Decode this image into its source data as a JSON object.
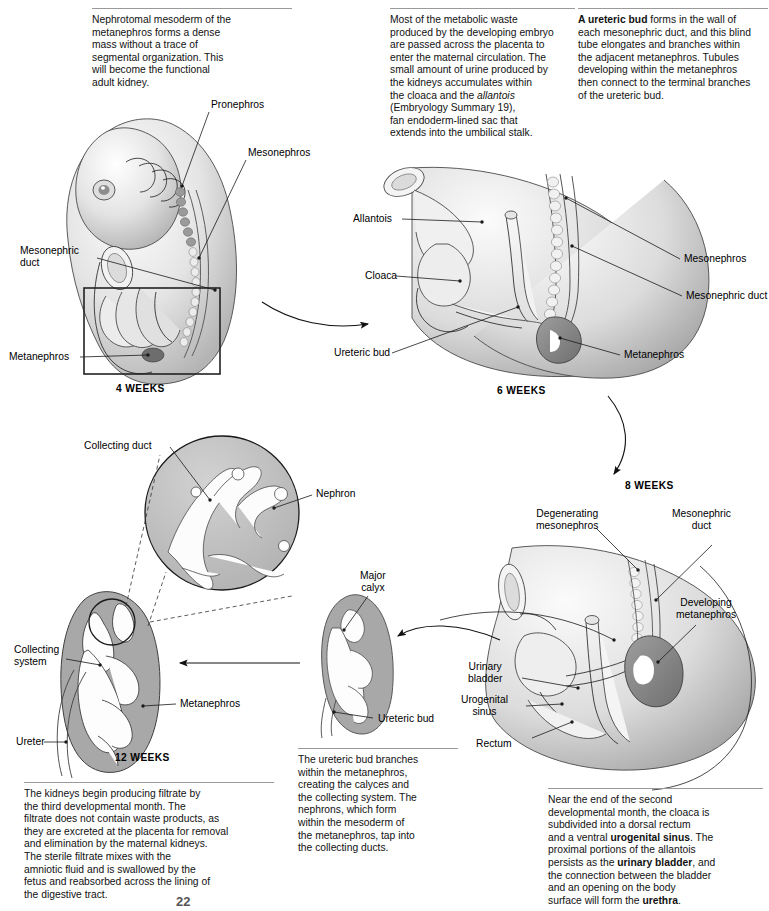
{
  "figure": {
    "page_number": "22"
  },
  "captions": {
    "metanephros_note": "Nephrotomal mesoderm of the\nmetanephros forms a dense\nmass without a trace of\nsegmental organization. This\nwill become the functional\nadult kidney.",
    "metabolic_waste_note_a": "Most of the metabolic waste\nproduced by the developing embryo\nare passed across the placenta to\nenter the maternal circulation. The\nsmall amount of urine produced by\nthe kidneys accumulates within\nthe cloaca and the ",
    "metabolic_waste_italic": "allantois",
    "metabolic_waste_note_b": "\n(Embryology Summary 19),\nfan endoderm-lined sac that\nextends into the umbilical stalk.",
    "ureteric_bud_bold": "A ureteric bud",
    "ureteric_bud_note": " forms in the wall of\neach mesonephric duct, and this blind\ntube elongates and branches within\nthe adjacent metanephros. Tubules\ndeveloping within the metanephros\nthen connect to the terminal branches\nof the ureteric bud.",
    "twelve_week_note": "The kidneys begin producing filtrate by\nthe third developmental month. The\nfiltrate does not contain waste products, as\nthey are excreted at the placenta for removal\nand elimination by the maternal kidneys.\nThe sterile filtrate mixes with the\namniotic fluid and is swallowed by the\nfetus and reabsorbed across the lining of\nthe digestive tract.",
    "ureteric_branch_note": "The ureteric bud branches\nwithin the metanephros,\ncreating the calyces and\nthe collecting system. The\nnephrons, which form\nwithin the mesoderm of\nthe metanephros, tap into\nthe collecting ducts.",
    "cloaca_subdivision_a": "Near the end of the second\ndevelopmental month, the cloaca is\nsubdivided into a dorsal rectum\nand a ventral ",
    "cloaca_subdivision_bold1": "urogenital sinus",
    "cloaca_subdivision_b": ". The\nproximal portions of the allantois\npersists as the ",
    "cloaca_subdivision_bold2": "urinary bladder",
    "cloaca_subdivision_c": ", and\nthe connection between the bladder\nand an opening on the body\nsurface will form the ",
    "cloaca_subdivision_bold3": "urethra",
    "cloaca_subdivision_d": "."
  },
  "stages": {
    "four_weeks": "4 WEEKS",
    "six_weeks": "6 WEEKS",
    "eight_weeks": "8 WEEKS",
    "twelve_weeks": "12 WEEKS"
  },
  "labels": {
    "pronephros": "Pronephros",
    "mesonephros_embryo": "Mesonephros",
    "mesonephric_duct_embryo": "Mesonephric\nduct",
    "metanephros_embryo": "Metanephros",
    "allantois": "Allantois",
    "cloaca": "Cloaca",
    "ureteric_bud_6w": "Ureteric bud",
    "mesonephros_6w": "Mesonephros",
    "mesonephric_duct_6w": "Mesonephric duct",
    "metanephros_6w": "Metanephros",
    "degenerating_mesonephros": "Degenerating\nmesonephros",
    "mesonephric_duct_8w": "Mesonephric\nduct",
    "developing_metanephros": "Developing\nmetanephros",
    "urinary_bladder": "Urinary\nbladder",
    "urogenital_sinus": "Urogenital\nsinus",
    "rectum": "Rectum",
    "collecting_duct": "Collecting duct",
    "nephron": "Nephron",
    "collecting_system": "Collecting\nsystem",
    "metanephros_12w": "Metanephros",
    "ureter": "Ureter",
    "major_calyx": "Major\ncalyx",
    "ureteric_bud_kidney": "Ureteric bud"
  },
  "colors": {
    "ink": "#1a1a1a",
    "rule": "#9a9a9a",
    "tissue_light": "#e8e8e8",
    "tissue_mid": "#c9c9c9",
    "tissue_dark": "#a5a5a5",
    "metanephros_fill": "#8f8f8f",
    "lumen": "#ffffff"
  }
}
